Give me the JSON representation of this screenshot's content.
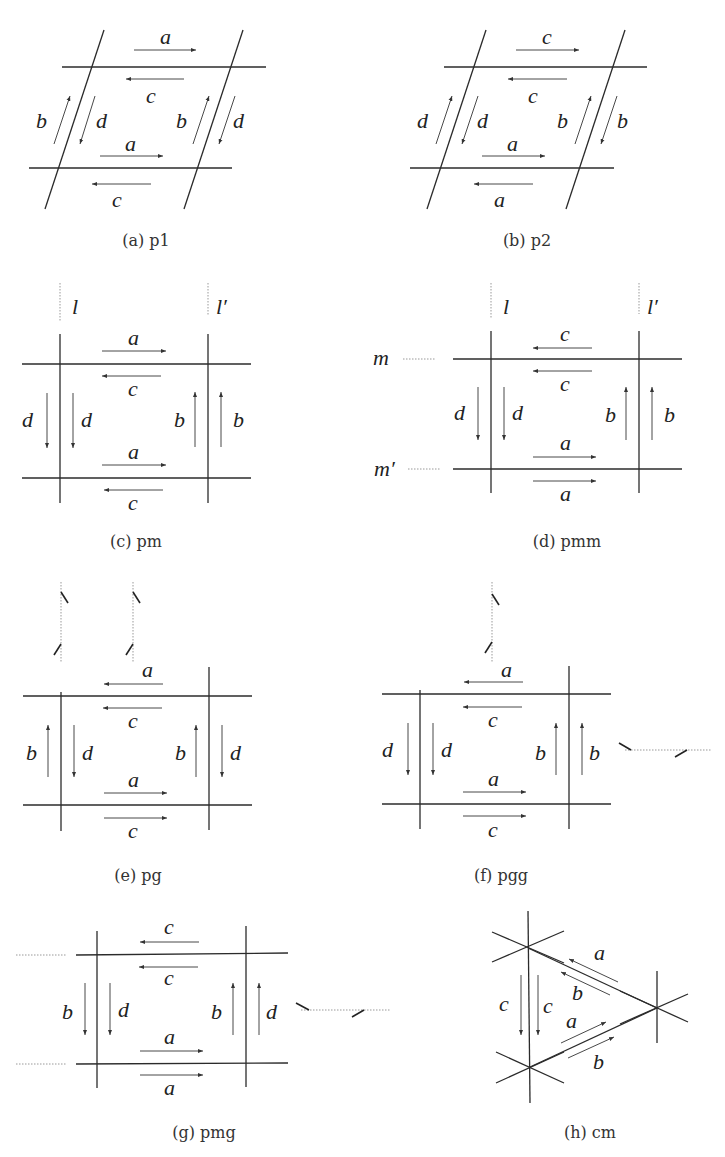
{
  "figure": {
    "panels": [
      {
        "id": "a",
        "caption": "(a) p1",
        "group": "p1",
        "edge_labels": {
          "top_outer": "a",
          "top_inner": "c",
          "bottom_inner": "a",
          "bottom_outer": "c",
          "left_outer": "b",
          "left_inner": "d",
          "right_inner": "b",
          "right_outer": "d"
        },
        "arrow_directions": {
          "top_outer": "right",
          "top_inner": "left",
          "bottom_inner": "right",
          "bottom_outer": "left",
          "left_outer": "up",
          "left_inner": "down",
          "right_inner": "up",
          "right_outer": "down"
        }
      },
      {
        "id": "b",
        "caption": "(b) p2",
        "group": "p2",
        "edge_labels": {
          "top_outer": "c",
          "top_inner": "c",
          "bottom_inner": "a",
          "bottom_outer": "a",
          "left_outer": "d",
          "left_inner": "d",
          "right_inner": "b",
          "right_outer": "b"
        },
        "arrow_directions": {
          "top_outer": "right",
          "top_inner": "left",
          "bottom_inner": "right",
          "bottom_outer": "left",
          "left_outer": "up",
          "left_inner": "down",
          "right_inner": "up",
          "right_outer": "down"
        }
      },
      {
        "id": "c",
        "caption": "(c) pm",
        "group": "pm",
        "mirror_labels": [
          "l",
          "l′"
        ],
        "edge_labels": {
          "top_outer": "a",
          "top_inner": "c",
          "bottom_inner": "a",
          "bottom_outer": "c",
          "left_outer": "d",
          "left_inner": "d",
          "right_inner": "b",
          "right_outer": "b"
        },
        "arrow_directions": {
          "top_outer": "right",
          "top_inner": "left",
          "bottom_inner": "right",
          "bottom_outer": "left",
          "left_outer": "down",
          "left_inner": "down",
          "right_inner": "up",
          "right_outer": "up"
        }
      },
      {
        "id": "d",
        "caption": "(d) pmm",
        "group": "pmm",
        "mirror_labels": [
          "l",
          "l′",
          "m",
          "m′"
        ],
        "edge_labels": {
          "top_outer": "c",
          "top_inner": "c",
          "bottom_inner": "a",
          "bottom_outer": "a",
          "left_outer": "d",
          "left_inner": "d",
          "right_inner": "b",
          "right_outer": "b"
        },
        "arrow_directions": {
          "top_outer": "left",
          "top_inner": "left",
          "bottom_inner": "right",
          "bottom_outer": "right",
          "left_outer": "down",
          "left_inner": "down",
          "right_inner": "up",
          "right_outer": "up"
        }
      },
      {
        "id": "e",
        "caption": "(e) pg",
        "group": "pg",
        "edge_labels": {
          "top_outer": "a",
          "top_inner": "c",
          "bottom_inner": "a",
          "bottom_outer": "c",
          "left_outer": "b",
          "left_inner": "d",
          "right_inner": "b",
          "right_outer": "d"
        },
        "arrow_directions": {
          "top_outer": "left",
          "top_inner": "left",
          "bottom_inner": "right",
          "bottom_outer": "right",
          "left_outer": "up",
          "left_inner": "down",
          "right_inner": "up",
          "right_outer": "down"
        }
      },
      {
        "id": "f",
        "caption": "(f) pgg",
        "group": "pgg",
        "edge_labels": {
          "top_outer": "a",
          "top_inner": "c",
          "bottom_inner": "a",
          "bottom_outer": "c",
          "left_outer": "d",
          "left_inner": "d",
          "right_inner": "b",
          "right_outer": "b"
        },
        "arrow_directions": {
          "top_outer": "left",
          "top_inner": "left",
          "bottom_inner": "right",
          "bottom_outer": "right",
          "left_outer": "down",
          "left_inner": "down",
          "right_inner": "up",
          "right_outer": "up"
        }
      },
      {
        "id": "g",
        "caption": "(g) pmg",
        "group": "pmg",
        "edge_labels": {
          "top_outer": "c",
          "top_inner": "c",
          "bottom_inner": "a",
          "bottom_outer": "a",
          "left_outer": "b",
          "left_inner": "d",
          "right_inner": "b",
          "right_outer": "d"
        },
        "arrow_directions": {
          "top_outer": "left",
          "top_inner": "left",
          "bottom_inner": "right",
          "bottom_outer": "right",
          "left_outer": "down",
          "left_inner": "down",
          "right_inner": "up",
          "right_outer": "up"
        }
      },
      {
        "id": "h",
        "caption": "(h) cm",
        "group": "cm",
        "edge_labels": {
          "upper_outer": "a",
          "upper_inner": "b",
          "lower_inner": "a",
          "lower_outer": "b",
          "left_outer": "c",
          "left_inner": "c"
        },
        "arrow_directions": {
          "upper_outer": "up-left",
          "upper_inner": "up-left",
          "lower_inner": "up-right",
          "lower_outer": "up-right",
          "left_outer": "down",
          "left_inner": "down"
        }
      }
    ]
  }
}
